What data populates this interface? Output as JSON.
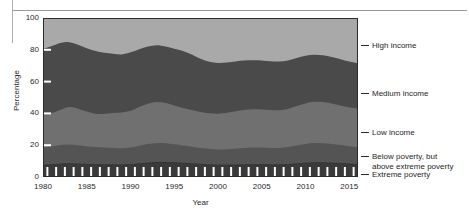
{
  "figure": {
    "kind": "stacked-area-chart",
    "width": 469,
    "height": 214
  },
  "axes": {
    "y_title": "Percentage",
    "x_title": "Year",
    "y_ticks": [
      "0",
      "20",
      "40",
      "60",
      "80",
      "100"
    ],
    "x_ticks": [
      "1980",
      "1985",
      "1990",
      "1995",
      "2000",
      "2005",
      "2010",
      "2015"
    ]
  },
  "series_labels": [
    {
      "name": "high-income",
      "text": "High income"
    },
    {
      "name": "medium-income",
      "text": "Medium income"
    },
    {
      "name": "low-income",
      "text": "Low income"
    },
    {
      "name": "below-poverty",
      "text": "Below poverty, but\nabove extreme poverty"
    },
    {
      "name": "extreme-poverty",
      "text": "Extreme poverty"
    }
  ],
  "colors": {
    "high_income": "#a9a9a9",
    "medium_income": "#4a4a4a",
    "low_income": "#707070",
    "below_poverty": "#545454",
    "extreme_poverty": "#3a3a3a",
    "axis": "#2b2b2b",
    "tick_mark": "#ffffff",
    "page_rule": "#9b9b9b",
    "text": "#1f1f1f",
    "background": "#ffffff"
  },
  "chart_data": {
    "type": "area",
    "stacked": true,
    "normalized_percent": true,
    "title": "",
    "xlabel": "Year",
    "ylabel": "Percentage",
    "xlim": [
      1980,
      2016
    ],
    "ylim": [
      0,
      100
    ],
    "grid": false,
    "legend_position": "right-outside",
    "x": [
      1980,
      1981,
      1982,
      1983,
      1984,
      1985,
      1986,
      1987,
      1988,
      1989,
      1990,
      1991,
      1992,
      1993,
      1994,
      1995,
      1996,
      1997,
      1998,
      1999,
      2000,
      2001,
      2002,
      2003,
      2004,
      2005,
      2006,
      2007,
      2008,
      2009,
      2010,
      2011,
      2012,
      2013,
      2014,
      2015,
      2016
    ],
    "series": [
      {
        "name": "Extreme poverty",
        "color": "#3a3a3a",
        "values": [
          7.5,
          7.8,
          8.2,
          8.4,
          8.2,
          8.0,
          7.8,
          7.7,
          7.7,
          7.6,
          7.8,
          8.3,
          8.8,
          9.2,
          9.2,
          9.0,
          8.7,
          8.4,
          8.0,
          7.7,
          7.5,
          7.5,
          7.6,
          7.7,
          7.8,
          7.8,
          7.7,
          7.7,
          7.9,
          8.3,
          8.7,
          9.0,
          9.0,
          8.8,
          8.5,
          8.2,
          8.0
        ]
      },
      {
        "name": "Below poverty, but above extreme poverty",
        "color": "#545454",
        "values": [
          11.0,
          11.4,
          11.9,
          12.1,
          11.8,
          11.4,
          11.0,
          10.8,
          10.6,
          10.5,
          10.8,
          11.4,
          11.9,
          12.1,
          12.0,
          11.6,
          11.1,
          10.7,
          10.3,
          10.0,
          9.8,
          9.9,
          10.2,
          10.5,
          10.7,
          10.7,
          10.6,
          10.6,
          10.9,
          11.5,
          12.1,
          12.4,
          12.3,
          12.0,
          11.6,
          11.2,
          10.9
        ]
      },
      {
        "name": "Low income",
        "color": "#707070",
        "values": [
          20.5,
          21.0,
          22.2,
          23.5,
          23.0,
          21.8,
          21.0,
          21.3,
          22.0,
          22.4,
          23.0,
          24.3,
          25.4,
          25.8,
          25.3,
          24.4,
          23.6,
          23.0,
          22.6,
          22.4,
          22.5,
          23.0,
          23.6,
          24.0,
          24.1,
          24.0,
          23.8,
          23.7,
          24.0,
          24.8,
          25.5,
          25.9,
          25.8,
          25.4,
          24.9,
          24.4,
          24.0
        ]
      },
      {
        "name": "Medium income",
        "color": "#4a4a4a",
        "values": [
          41.5,
          42.2,
          42.0,
          40.8,
          40.2,
          39.8,
          39.4,
          38.4,
          37.2,
          36.6,
          36.8,
          36.4,
          36.0,
          35.8,
          35.6,
          35.7,
          35.8,
          34.9,
          33.4,
          32.4,
          31.9,
          31.6,
          31.3,
          31.0,
          30.8,
          30.8,
          30.7,
          30.6,
          30.4,
          30.2,
          30.0,
          29.6,
          29.4,
          29.2,
          29.0,
          28.8,
          28.6
        ]
      },
      {
        "name": "High income",
        "color": "#a9a9a9",
        "values": [
          19.5,
          17.6,
          15.7,
          15.2,
          16.8,
          19.0,
          20.8,
          21.8,
          22.5,
          22.9,
          21.6,
          19.6,
          17.9,
          17.1,
          17.9,
          19.3,
          20.8,
          23.0,
          25.7,
          27.5,
          28.3,
          28.0,
          27.3,
          26.8,
          26.6,
          26.7,
          27.2,
          27.4,
          26.8,
          25.2,
          23.7,
          23.1,
          23.5,
          24.6,
          26.0,
          27.4,
          28.5
        ]
      }
    ],
    "cumulative_upper_bounds": {
      "extreme_poverty_top": [
        7.5,
        7.8,
        8.2,
        8.4,
        8.2,
        8.0,
        7.8,
        7.7,
        7.7,
        7.6,
        7.8,
        8.3,
        8.8,
        9.2,
        9.2,
        9.0,
        8.7,
        8.4,
        8.0,
        7.7,
        7.5,
        7.5,
        7.6,
        7.7,
        7.8,
        7.8,
        7.7,
        7.7,
        7.9,
        8.3,
        8.7,
        9.0,
        9.0,
        8.8,
        8.5,
        8.2,
        8.0
      ],
      "below_poverty_top": [
        18.5,
        19.2,
        20.1,
        20.5,
        20.0,
        19.4,
        18.8,
        18.5,
        18.3,
        18.1,
        18.6,
        19.7,
        20.7,
        21.3,
        21.2,
        20.6,
        19.8,
        19.1,
        18.3,
        17.7,
        17.3,
        17.4,
        17.8,
        18.2,
        18.5,
        18.5,
        18.3,
        18.3,
        18.8,
        19.8,
        20.8,
        21.4,
        21.3,
        20.8,
        20.1,
        19.4,
        18.9
      ],
      "low_income_top": [
        39.0,
        40.2,
        42.3,
        44.0,
        43.0,
        41.2,
        39.8,
        39.8,
        40.3,
        40.5,
        41.6,
        44.0,
        46.1,
        47.1,
        46.5,
        45.0,
        43.4,
        42.1,
        40.9,
        40.1,
        39.8,
        40.4,
        41.4,
        42.2,
        42.6,
        42.5,
        42.1,
        42.0,
        42.8,
        44.6,
        46.3,
        47.3,
        47.1,
        46.2,
        45.0,
        43.8,
        42.9
      ],
      "medium_income_top": [
        80.5,
        82.4,
        84.3,
        84.8,
        83.2,
        81.0,
        79.2,
        78.2,
        77.5,
        77.1,
        78.4,
        80.4,
        82.1,
        82.9,
        82.1,
        80.7,
        79.2,
        77.0,
        74.3,
        72.5,
        71.7,
        72.0,
        72.7,
        73.2,
        73.4,
        73.3,
        72.8,
        72.6,
        73.2,
        74.8,
        76.3,
        76.9,
        76.5,
        75.4,
        74.0,
        72.6,
        71.5
      ],
      "high_income_top": [
        100,
        100,
        100,
        100,
        100,
        100,
        100,
        100,
        100,
        100,
        100,
        100,
        100,
        100,
        100,
        100,
        100,
        100,
        100,
        100,
        100,
        100,
        100,
        100,
        100,
        100,
        100,
        100,
        100,
        100,
        100,
        100,
        100,
        100,
        100,
        100,
        100
      ]
    }
  }
}
